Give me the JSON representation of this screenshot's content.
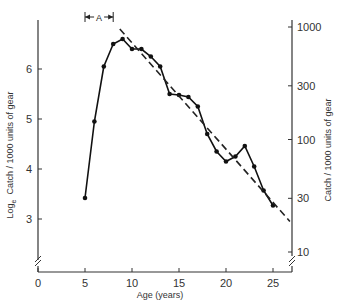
{
  "chart_data": {
    "type": "line",
    "title": "",
    "xlabel": "Age  (years)",
    "ylabel_left": "Log_e  Catch / 1000 units of gear",
    "ylabel_left_main": "Log",
    "ylabel_left_sub": "e",
    "ylabel_left_rest": "Catch / 1000 units of gear",
    "ylabel_right": "Catch / 1000 units of gear",
    "xlim": [
      0,
      27.5
    ],
    "ylim": [
      2.1,
      6.9
    ],
    "x_ticks": [
      0,
      5,
      10,
      15,
      20,
      25
    ],
    "y_ticks_left": [
      3,
      4,
      5,
      6
    ],
    "y_ticks_right": [
      10,
      30,
      100,
      300,
      1000
    ],
    "grid": false,
    "axis_breaks": [
      "left-y",
      "right-y"
    ],
    "annotation": {
      "label": "A",
      "x_from": 5,
      "x_to": 8,
      "style": "bracket-arrow"
    },
    "series": [
      {
        "name": "observed",
        "style": "solid-with-markers",
        "x": [
          5,
          6,
          7,
          8,
          9,
          10,
          11,
          12,
          13,
          14,
          15,
          16,
          17,
          18,
          19,
          20,
          21,
          22,
          23,
          24,
          25
        ],
        "values": [
          3.42,
          4.95,
          6.05,
          6.5,
          6.6,
          6.4,
          6.4,
          6.25,
          6.05,
          5.5,
          5.48,
          5.44,
          5.25,
          4.7,
          4.35,
          4.15,
          4.25,
          4.46,
          4.05,
          3.57,
          3.27
        ]
      },
      {
        "name": "fitted regression",
        "style": "dashed",
        "x": [
          8.7,
          26.8
        ],
        "values": [
          6.8,
          2.95
        ]
      }
    ]
  }
}
